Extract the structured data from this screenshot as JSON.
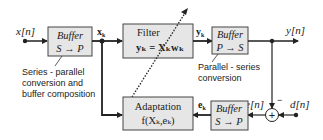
{
  "diagram": {
    "signals": {
      "input": "x[n]",
      "output": "y[n]",
      "desired": "d[n]",
      "error": "e[n]",
      "xk": "x",
      "xk_sub": "k",
      "yk": "y",
      "yk_sub": "k",
      "ek": "e",
      "ek_sub": "k",
      "minus_sign": "−"
    },
    "blocks": {
      "buffer_in": {
        "title": "Buffer",
        "op": "S → P"
      },
      "filter": {
        "title": "Filter",
        "equation": "yₖ = Xₖwₖ"
      },
      "buffer_out": {
        "title": "Buffer",
        "op": "P → S"
      },
      "adaptation": {
        "title": "Adaptation",
        "equation": "f(Xₖ,eₖ)"
      },
      "buffer_err": {
        "title": "Buffer",
        "op": "S → P"
      },
      "summer": {
        "symbol": "+"
      }
    },
    "annotations": {
      "series_parallel": [
        "Series - parallel",
        "conversion and",
        "buffer composition"
      ],
      "parallel_series": [
        "Parallel - series",
        "conversion"
      ]
    },
    "colors": {
      "block_fill": "#e6e6e6",
      "stroke": "#333333",
      "text": "#222222"
    }
  }
}
